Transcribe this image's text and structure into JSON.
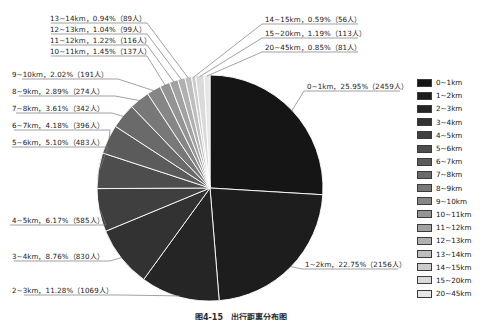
{
  "chart_data": {
    "type": "pie",
    "title": "",
    "xlabel": "",
    "ylabel": "",
    "unit_suffix": "人",
    "legend_position": "right",
    "grid": false,
    "start_angle_deg": -90,
    "direction": "clockwise",
    "categories": [
      "0~1km",
      "1~2km",
      "2~3km",
      "3~4km",
      "4~5km",
      "5~6km",
      "6~7km",
      "7~8km",
      "8~9km",
      "9~10km",
      "10~11km",
      "11~12km",
      "12~13km",
      "13~14km",
      "14~15km",
      "15~20km",
      "20~45km"
    ],
    "values": [
      25.95,
      22.75,
      11.28,
      8.76,
      6.17,
      5.1,
      4.18,
      3.61,
      2.89,
      2.02,
      1.45,
      1.22,
      1.04,
      0.94,
      0.59,
      1.19,
      0.85
    ],
    "counts": [
      2459,
      2156,
      1069,
      830,
      585,
      483,
      396,
      342,
      274,
      191,
      137,
      116,
      99,
      89,
      56,
      113,
      81
    ],
    "colors": [
      "#151515",
      "#1d1d1d",
      "#252525",
      "#323232",
      "#3f3f3f",
      "#4d4d4d",
      "#5b5b5b",
      "#6a6a6a",
      "#787878",
      "#868686",
      "#949494",
      "#a2a2a2",
      "#b0b0b0",
      "#bebebe",
      "#cccccc",
      "#dadada",
      "#e6e6e6"
    ]
  },
  "labels": {
    "l_0_1": "0~1km，25.95%（2459人）",
    "l_1_2": "1~2km，22.75%（2156人）",
    "l_2_3": "2~3km，11.28%（1069人）",
    "l_3_4": "3~4km，8.76%（830人）",
    "l_4_5": "4~5km，6.17%（585人）",
    "l_5_6": "5~6km，5.10%（483人）",
    "l_6_7": "6~7km，4.18%（396人）",
    "l_7_8": "7~8km，3.61%（342人）",
    "l_8_9": "8~9km，2.89%（274人）",
    "l_9_10": "9~10km，2.02%（191人）",
    "l_10_11": "10~11km，1.45%（137人）",
    "l_11_12": "11~12km，1.22%（116人）",
    "l_12_13": "12~13km，1.04%（99人）",
    "l_13_14": "13~14km，0.94%（89人）",
    "l_14_15": "14~15km，0.59%（56人）",
    "l_15_20": "15~20km，1.19%（113人）",
    "l_20_45": "20~45km，0.85%（81人）"
  },
  "legend": {
    "items": [
      {
        "label": "0~1km",
        "color": "#151515"
      },
      {
        "label": "1~2km",
        "color": "#1d1d1d"
      },
      {
        "label": "2~3km",
        "color": "#252525"
      },
      {
        "label": "3~4km",
        "color": "#323232"
      },
      {
        "label": "4~5km",
        "color": "#3f3f3f"
      },
      {
        "label": "5~6km",
        "color": "#4d4d4d"
      },
      {
        "label": "6~7km",
        "color": "#5b5b5b"
      },
      {
        "label": "7~8km",
        "color": "#6a6a6a"
      },
      {
        "label": "8~9km",
        "color": "#787878"
      },
      {
        "label": "9~10km",
        "color": "#868686"
      },
      {
        "label": "10~11km",
        "color": "#949494"
      },
      {
        "label": "11~12km",
        "color": "#a2a2a2"
      },
      {
        "label": "12~13km",
        "color": "#b0b0b0"
      },
      {
        "label": "13~14km",
        "color": "#bebebe"
      },
      {
        "label": "14~15km",
        "color": "#cccccc"
      },
      {
        "label": "15~20km",
        "color": "#dadada"
      },
      {
        "label": "20~45km",
        "color": "#e6e6e6"
      }
    ]
  },
  "caption": {
    "text": "图4-15　出行距离分布图"
  }
}
